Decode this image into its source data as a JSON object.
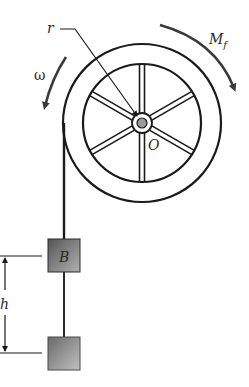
{
  "diagram": {
    "labels": {
      "radius": "r",
      "friction_moment": "M",
      "friction_moment_sub": "f",
      "angular_velocity": "ω",
      "center": "O",
      "block_b": "B",
      "height": "h"
    },
    "colors": {
      "stroke": "#1a1a1a",
      "arrow": "#3a3a3a",
      "block_dark": "#4a4a4a",
      "block_light": "#a8a8a8"
    }
  }
}
